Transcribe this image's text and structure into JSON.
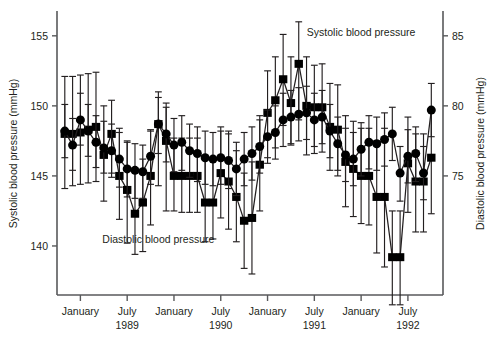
{
  "chart_data": {
    "type": "line",
    "title": "",
    "xlabel": "",
    "ylabel": "Systolic blood pressure (mmHg)",
    "y2label": "Diastolic blood pressure (mmHg)",
    "grid": false,
    "legend_position": "inline-annotations",
    "annotations": [
      {
        "text": "Systolic blood pressure",
        "x_index": 38,
        "y_value": 155.0
      },
      {
        "text": "Diastolic blood pressure",
        "x_index": 12,
        "y_value": 70.2
      }
    ],
    "left_axis": {
      "label": "Systolic blood pressure (mmHg)",
      "ticks": [
        155,
        150,
        145,
        140
      ],
      "ticklabels": [
        "155",
        "150",
        "145",
        "140"
      ],
      "ylim": [
        136.5,
        156.7
      ]
    },
    "right_axis": {
      "label": "Diastolic blood pressure (mmHg)",
      "ticks": [
        85,
        80,
        75
      ],
      "ticklabels": [
        "85",
        "80",
        "75"
      ],
      "ylim": [
        66.5,
        86.7
      ]
    },
    "x_axis": {
      "tick_indices": [
        2,
        8,
        14,
        20,
        26,
        32,
        38,
        44
      ],
      "ticklabels": [
        "January",
        "July",
        "January",
        "July",
        "January",
        "July",
        "January",
        "July"
      ],
      "ticksublabels": [
        "",
        "1989",
        "",
        "1990",
        "",
        "1991",
        "",
        "1992"
      ],
      "xlim": [
        -1.0,
        48.5
      ]
    },
    "series": [
      {
        "name": "Systolic blood pressure",
        "marker": "square",
        "axis": "left",
        "units": "mmHg",
        "x": [
          0,
          1,
          2,
          3,
          4,
          5,
          6,
          7,
          8,
          9,
          10,
          11,
          12,
          13,
          14,
          15,
          16,
          17,
          18,
          19,
          20,
          21,
          22,
          23,
          24,
          25,
          26,
          27,
          28,
          29,
          30,
          31,
          32,
          33,
          34,
          35,
          36,
          37,
          38,
          39,
          40,
          41,
          42,
          43,
          44,
          45,
          46,
          47
        ],
        "values": [
          148.0,
          148.0,
          148.1,
          148.3,
          148.5,
          146.5,
          148.0,
          145.0,
          144.0,
          142.3,
          143.1,
          145.0,
          148.7,
          147.5,
          145.0,
          145.0,
          145.0,
          145.0,
          143.1,
          143.1,
          145.2,
          144.6,
          143.5,
          141.8,
          142.0,
          145.8,
          149.5,
          150.4,
          151.9,
          150.2,
          153.0,
          150.0,
          149.9,
          149.9,
          148.5,
          148.3,
          146.0,
          145.5,
          145.0,
          145.0,
          143.5,
          143.5,
          139.2,
          139.2,
          145.9,
          144.6,
          144.6,
          146.3
        ],
        "err_low": [
          144.1,
          144.3,
          144.4,
          144.5,
          144.6,
          143.2,
          145.2,
          141.9,
          140.2,
          139.4,
          139.6,
          141.5,
          144.3,
          142.5,
          142.5,
          142.4,
          142.4,
          142.4,
          140.3,
          140.5,
          142.0,
          141.2,
          140.3,
          138.4,
          138.0,
          142.5,
          146.3,
          147.0,
          148.6,
          147.2,
          149.0,
          146.5,
          146.6,
          146.7,
          145.4,
          145.0,
          142.8,
          142.1,
          141.6,
          141.5,
          139.5,
          138.5,
          135.8,
          135.8,
          142.4,
          141.0,
          141.0,
          142.3
        ],
        "err_high": [
          152.1,
          152.1,
          152.2,
          152.3,
          152.4,
          150.0,
          150.4,
          148.4,
          147.5,
          145.5,
          146.2,
          148.2,
          151.0,
          150.2,
          147.7,
          147.7,
          147.7,
          147.7,
          146.3,
          146.3,
          148.5,
          148.2,
          146.8,
          145.2,
          146.0,
          149.3,
          152.5,
          153.5,
          155.1,
          153.5,
          156.0,
          153.5,
          152.9,
          153.0,
          151.6,
          151.5,
          149.3,
          148.9,
          148.4,
          148.4,
          147.5,
          148.4,
          142.5,
          142.5,
          149.2,
          148.0,
          148.0,
          149.6
        ]
      },
      {
        "name": "Diastolic blood pressure",
        "marker": "circle",
        "axis": "right",
        "units": "mmHg",
        "x": [
          0,
          1,
          2,
          3,
          4,
          5,
          6,
          7,
          8,
          9,
          10,
          11,
          12,
          13,
          14,
          15,
          16,
          17,
          18,
          19,
          20,
          21,
          22,
          23,
          24,
          25,
          26,
          27,
          28,
          29,
          30,
          31,
          32,
          33,
          34,
          35,
          36,
          37,
          38,
          39,
          40,
          41,
          42,
          43,
          44,
          45,
          46,
          47
        ],
        "values": [
          78.2,
          77.2,
          79.0,
          78.2,
          77.4,
          77.0,
          76.8,
          76.2,
          75.5,
          75.4,
          75.3,
          76.4,
          78.7,
          78.0,
          77.2,
          77.4,
          76.8,
          76.6,
          76.3,
          76.2,
          76.3,
          76.1,
          75.5,
          76.2,
          76.6,
          77.1,
          77.8,
          78.1,
          79.0,
          79.2,
          79.4,
          79.5,
          79.0,
          79.2,
          78.2,
          77.3,
          76.5,
          76.2,
          76.9,
          77.4,
          77.3,
          77.6,
          78.0,
          75.2,
          76.4,
          76.6,
          75.2,
          79.7
        ],
        "err_low": [
          76.3,
          75.4,
          77.2,
          76.4,
          75.6,
          75.2,
          74.9,
          74.2,
          73.5,
          73.4,
          73.4,
          74.4,
          76.6,
          76.0,
          75.3,
          75.4,
          74.9,
          74.6,
          74.4,
          74.3,
          74.4,
          74.1,
          73.6,
          74.3,
          74.7,
          75.2,
          75.9,
          76.2,
          77.1,
          77.3,
          77.5,
          77.6,
          77.1,
          77.3,
          76.3,
          75.4,
          74.6,
          74.3,
          75.0,
          75.5,
          75.4,
          75.7,
          76.1,
          73.2,
          74.5,
          74.6,
          73.3,
          77.8
        ],
        "err_high": [
          80.1,
          79.1,
          80.9,
          80.1,
          79.3,
          78.9,
          78.7,
          78.1,
          77.4,
          77.3,
          77.2,
          78.3,
          80.6,
          79.9,
          79.1,
          79.3,
          78.7,
          78.5,
          78.2,
          78.1,
          78.2,
          78.0,
          77.4,
          78.1,
          78.5,
          79.0,
          79.7,
          80.0,
          80.9,
          81.1,
          81.3,
          81.4,
          80.9,
          81.1,
          80.1,
          79.2,
          78.4,
          78.1,
          78.8,
          79.3,
          79.2,
          79.5,
          79.9,
          77.1,
          78.3,
          78.5,
          77.1,
          81.6
        ]
      }
    ]
  },
  "labels": {
    "systolic_annotation": "Systolic blood pressure",
    "diastolic_annotation": "Diastolic blood pressure",
    "left_axis_title": "Systolic blood pressure (mmHg)",
    "right_axis_title": "Diastolic blood pressure (mmHg)"
  }
}
